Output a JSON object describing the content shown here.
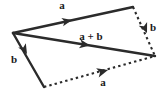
{
  "figure": {
    "name": "vector-addition-parallelogram",
    "background_color": "#ffffff",
    "stroke_color": "#2b2b2b",
    "label_color": "#1a1a1a",
    "width": 166,
    "height": 96
  },
  "vertices": {
    "origin": {
      "x": 13,
      "y": 33
    },
    "top_right": {
      "x": 133,
      "y": 7
    },
    "bottom_left": {
      "x": 44,
      "y": 87
    },
    "right": {
      "x": 155,
      "y": 56
    }
  },
  "vectors": [
    {
      "id": "a-top",
      "label": "a",
      "style": "solid",
      "from": {
        "x": 13,
        "y": 33
      },
      "to": {
        "x": 133,
        "y": 7
      },
      "arrow_at": {
        "x": 68,
        "y": 21
      },
      "label_pos": {
        "x": 62,
        "y": 9
      }
    },
    {
      "id": "b-right",
      "label": "b",
      "style": "dashed",
      "from": {
        "x": 133,
        "y": 7
      },
      "to": {
        "x": 155,
        "y": 56
      },
      "arrow_at": {
        "x": 146,
        "y": 32
      },
      "label_pos": {
        "x": 153,
        "y": 31
      }
    },
    {
      "id": "b-left",
      "label": "b",
      "style": "solid",
      "from": {
        "x": 13,
        "y": 33
      },
      "to": {
        "x": 44,
        "y": 87
      },
      "arrow_at": {
        "x": 25,
        "y": 52
      },
      "label_pos": {
        "x": 14,
        "y": 63
      }
    },
    {
      "id": "a-bottom",
      "label": "a",
      "style": "dashed",
      "from": {
        "x": 44,
        "y": 87
      },
      "to": {
        "x": 155,
        "y": 56
      },
      "arrow_at": {
        "x": 104,
        "y": 71
      },
      "label_pos": {
        "x": 103,
        "y": 86
      }
    },
    {
      "id": "a-plus-b",
      "label": "a + b",
      "style": "solid",
      "from": {
        "x": 13,
        "y": 33
      },
      "to": {
        "x": 155,
        "y": 56
      },
      "arrow_at": {
        "x": 86,
        "y": 45
      },
      "label_pos": {
        "x": 79,
        "y": 40
      }
    }
  ]
}
